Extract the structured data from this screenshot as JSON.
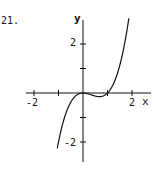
{
  "problem_number": "21.",
  "chart_data": {
    "type": "line",
    "title": "",
    "xlabel": "x",
    "ylabel": "y",
    "function": "y = x^3 - x^2",
    "x_ticks": [
      -2,
      -1,
      1,
      2
    ],
    "x_tick_labels": [
      "-2",
      "2"
    ],
    "y_ticks": [
      -2,
      -1,
      1,
      2
    ],
    "y_tick_labels": [
      "2",
      "-2"
    ],
    "xlim": [
      -2.3,
      2.7
    ],
    "ylim": [
      -3.2,
      3.2
    ],
    "grid": false,
    "series": [
      {
        "name": "curve",
        "x": [
          -1.05,
          -0.8,
          -0.5,
          -0.25,
          0,
          0.25,
          0.5,
          0.67,
          0.85,
          1,
          1.25,
          1.5,
          1.75,
          1.88
        ],
        "y": [
          -2.26,
          -1.15,
          -0.38,
          -0.08,
          0,
          -0.05,
          -0.13,
          -0.15,
          -0.11,
          0,
          0.39,
          1.13,
          2.3,
          3.11
        ]
      }
    ]
  },
  "labels": {
    "x_axis": "x",
    "y_axis": "y",
    "x_neg2": "-2",
    "x_pos2": "2",
    "y_pos2": "2",
    "y_neg2": "-2"
  }
}
